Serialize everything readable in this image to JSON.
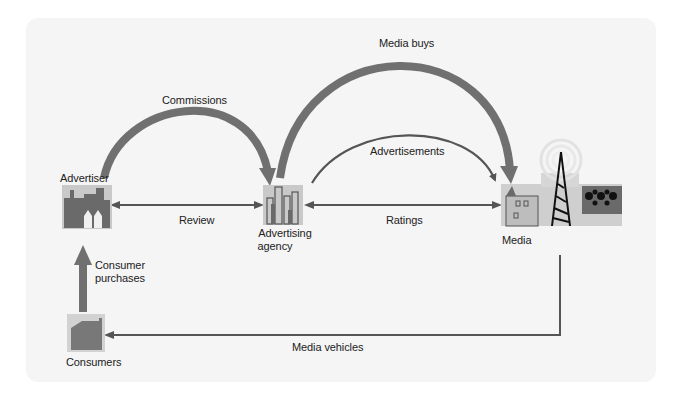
{
  "diagram": {
    "nodes": {
      "advertiser": {
        "label": "Advertiser"
      },
      "agency": {
        "label_line1": "Advertising",
        "label_line2": "agency"
      },
      "media": {
        "label": "Media"
      },
      "consumers": {
        "label": "Consumers"
      }
    },
    "flows": {
      "commissions": "Commissions",
      "media_buys": "Media buys",
      "advertisements": "Advertisements",
      "review": "Review",
      "ratings": "Ratings",
      "consumer_purchases_line1": "Consumer",
      "consumer_purchases_line2": "purchases",
      "media_vehicles": "Media vehicles"
    },
    "colors": {
      "panel_bg": "#f5f5f5",
      "thick_arrow": "#6e6e6e",
      "thin_arrow": "#555555",
      "icon_dark": "#666666",
      "icon_bg": "#c8c8c8"
    }
  }
}
